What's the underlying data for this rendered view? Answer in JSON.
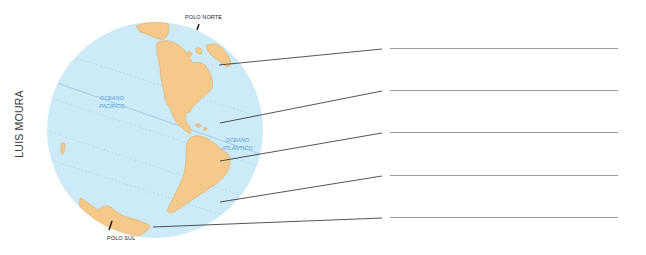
{
  "credit": "LUIS MOURA",
  "globe": {
    "ocean_color": "#cdeaf7",
    "land_color": "#f4c98a",
    "land_stroke": "#d9a560",
    "grid_color": "#a9cfe3",
    "poles": {
      "north": "POLO NORTE",
      "south": "POLO SUL"
    },
    "oceans": [
      {
        "name": "OCEANO\nPACÍFICO"
      },
      {
        "name": "OCEANO\nATLÂNTICO"
      }
    ]
  },
  "answer_lines": [
    {
      "value": ""
    },
    {
      "value": ""
    },
    {
      "value": ""
    },
    {
      "value": ""
    },
    {
      "value": ""
    }
  ]
}
